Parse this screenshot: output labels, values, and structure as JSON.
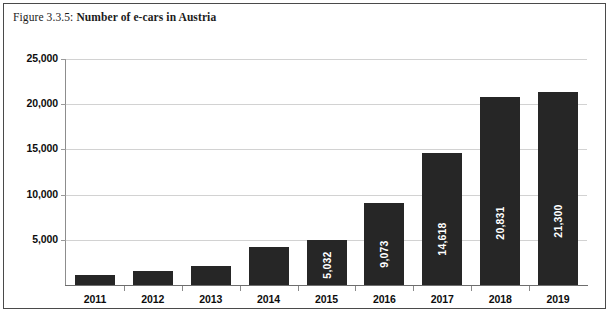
{
  "caption": {
    "figure_number": "Figure 3.3.5:",
    "title": "Number of e-cars in Austria"
  },
  "chart_data": {
    "type": "bar",
    "title": "Number of e-cars in Austria",
    "xlabel": "",
    "ylabel": "",
    "categories": [
      "2011",
      "2012",
      "2013",
      "2014",
      "2015",
      "2016",
      "2017",
      "2018",
      "2019"
    ],
    "values": [
      1100,
      1500,
      2100,
      4150,
      5032,
      9073,
      14618,
      20831,
      21300
    ],
    "value_labels": [
      "",
      "",
      "",
      "",
      "5,032",
      "9,073",
      "14,618",
      "20,831",
      "21,300"
    ],
    "ylim": [
      0,
      25000
    ],
    "yticks": [
      5000,
      10000,
      15000,
      20000,
      25000
    ],
    "ytick_labels": [
      "5,000",
      "10,000",
      "15,000",
      "20,000",
      "25,000"
    ],
    "grid": true,
    "legend": "none",
    "bar_color": "#262626",
    "gridline_color": "#d2d2d2",
    "value_label_color": "#ffffff"
  }
}
